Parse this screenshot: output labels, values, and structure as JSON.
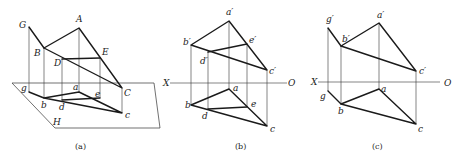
{
  "figures": {
    "a": {
      "caption": "(a)",
      "plane_label": "H",
      "points_space": {
        "G": "G",
        "A": "A",
        "B": "B",
        "E": "E",
        "D": "D",
        "C": "C"
      },
      "points_proj": {
        "g": "g",
        "a": "a",
        "b": "b",
        "d": "d",
        "e": "e",
        "c": "c"
      }
    },
    "b": {
      "caption": "(b)",
      "axis": {
        "x": "X",
        "o": "O"
      },
      "points_front": {
        "a": "a′",
        "b": "b′",
        "e": "e′",
        "d": "d′",
        "c": "c′"
      },
      "points_top": {
        "a": "a",
        "b": "b",
        "d": "d",
        "e": "e",
        "c": "c"
      }
    },
    "c": {
      "caption": "(c)",
      "axis": {
        "x": "X",
        "o": "O"
      },
      "points_front": {
        "g": "g′",
        "a": "a′",
        "b": "b′",
        "c": "c′"
      },
      "points_top": {
        "g": "g",
        "a": "a",
        "b": "b",
        "c": "c"
      }
    }
  },
  "colors": {
    "line": "#1a1a1a",
    "background": "#ffffff"
  }
}
